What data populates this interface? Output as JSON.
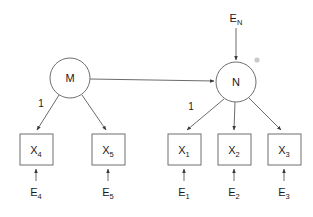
{
  "diagram": {
    "canvas": {
      "width": 313,
      "height": 217,
      "background": "#ffffff"
    },
    "colors": {
      "stroke": "#6f6f6f",
      "edge": "#5a5a5a",
      "text": "#1a1a1a",
      "fill": "#ffffff",
      "speck": "#c9c9c9"
    },
    "latent_nodes": [
      {
        "id": "M",
        "label": "M",
        "shape": "circle",
        "cx": 70,
        "cy": 78,
        "r": 20
      },
      {
        "id": "N",
        "label": "N",
        "shape": "circle",
        "cx": 236,
        "cy": 82,
        "r": 20
      }
    ],
    "observed_nodes": [
      {
        "id": "X4",
        "label": "X",
        "sub": "4",
        "shape": "rect",
        "x": 20,
        "y": 134,
        "w": 33,
        "h": 31
      },
      {
        "id": "X5",
        "label": "X",
        "sub": "5",
        "shape": "rect",
        "x": 92,
        "y": 134,
        "w": 33,
        "h": 31
      },
      {
        "id": "X1",
        "label": "X",
        "sub": "1",
        "shape": "rect",
        "x": 168,
        "y": 134,
        "w": 33,
        "h": 31
      },
      {
        "id": "X2",
        "label": "X",
        "sub": "2",
        "shape": "rect",
        "x": 218,
        "y": 134,
        "w": 33,
        "h": 31
      },
      {
        "id": "X3",
        "label": "X",
        "sub": "3",
        "shape": "rect",
        "x": 268,
        "y": 134,
        "w": 33,
        "h": 31
      }
    ],
    "error_terms": [
      {
        "id": "E4",
        "label": "E",
        "sub": "4",
        "x": 36,
        "y": 192
      },
      {
        "id": "E5",
        "label": "E",
        "sub": "5",
        "x": 108,
        "y": 192
      },
      {
        "id": "E1",
        "label": "E",
        "sub": "1",
        "x": 184,
        "y": 192
      },
      {
        "id": "E2",
        "label": "E",
        "sub": "2",
        "x": 234,
        "y": 192
      },
      {
        "id": "E3",
        "label": "E",
        "sub": "3",
        "x": 284,
        "y": 192
      },
      {
        "id": "EN",
        "label": "E",
        "sub": "N",
        "x": 236,
        "y": 20
      }
    ],
    "path_labels": [
      {
        "id": "loading-m-x4",
        "text": "1",
        "x": 41,
        "y": 107
      },
      {
        "id": "loading-n-x1",
        "text": "1",
        "x": 191,
        "y": 110
      }
    ],
    "edges": [
      {
        "id": "m-to-n",
        "from": "M",
        "to": "N",
        "type": "directed",
        "kind": "structural"
      },
      {
        "id": "m-to-x4",
        "from": "M",
        "to": "X4",
        "type": "directed",
        "kind": "loading",
        "coefficient": "1"
      },
      {
        "id": "m-to-x5",
        "from": "M",
        "to": "X5",
        "type": "directed",
        "kind": "loading"
      },
      {
        "id": "n-to-x1",
        "from": "N",
        "to": "X1",
        "type": "directed",
        "kind": "loading",
        "coefficient": "1"
      },
      {
        "id": "n-to-x2",
        "from": "N",
        "to": "X2",
        "type": "directed",
        "kind": "loading"
      },
      {
        "id": "n-to-x3",
        "from": "N",
        "to": "X3",
        "type": "directed",
        "kind": "loading"
      },
      {
        "id": "en-to-n",
        "from": "EN",
        "to": "N",
        "type": "directed",
        "kind": "disturbance"
      },
      {
        "id": "e4-to-x4",
        "from": "E4",
        "to": "X4",
        "type": "directed",
        "kind": "residual"
      },
      {
        "id": "e5-to-x5",
        "from": "E5",
        "to": "X5",
        "type": "directed",
        "kind": "residual"
      },
      {
        "id": "e1-to-x1",
        "from": "E1",
        "to": "X1",
        "type": "directed",
        "kind": "residual"
      },
      {
        "id": "e2-to-x2",
        "from": "E2",
        "to": "X2",
        "type": "directed",
        "kind": "residual"
      },
      {
        "id": "e3-to-x3",
        "from": "E3",
        "to": "X3",
        "type": "directed",
        "kind": "residual"
      }
    ],
    "artifacts": [
      {
        "id": "speck",
        "x": 257,
        "y": 60,
        "r": 2.6
      }
    ]
  }
}
